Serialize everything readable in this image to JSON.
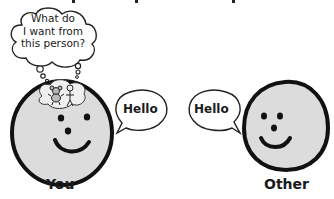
{
  "top_cropped_text": "",
  "thought_bubble": {
    "text_lines": [
      "What do",
      "I want from",
      "this person?"
    ]
  },
  "you": {
    "label": "You",
    "speech": "Hello",
    "thought_icons": [
      "teddy-bear-icon",
      "stick-figure-icon"
    ]
  },
  "other": {
    "label": "Other",
    "speech": "Hello"
  },
  "colors": {
    "face_fill": "#dcdcdc",
    "outline": "#111111",
    "bubble_fill": "#ffffff",
    "background": "#ffffff"
  }
}
